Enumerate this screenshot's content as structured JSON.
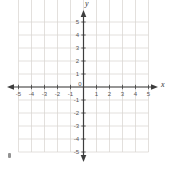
{
  "figure": {
    "background": "#ffffff",
    "axis_color": "#3d3d3d",
    "grid_color": "#d9d6d1",
    "tick_label_color": "#555555",
    "axis_label_color": "#333333",
    "origin_label": "0"
  },
  "chart_data": {
    "type": "scatter",
    "title": "",
    "xlabel": "x",
    "ylabel": "y",
    "xlim": [
      -5,
      5
    ],
    "ylim": [
      -5,
      5
    ],
    "x_ticks": [
      -5,
      -4,
      -3,
      -2,
      -1,
      1,
      2,
      3,
      4,
      5
    ],
    "y_ticks": [
      5,
      4,
      3,
      2,
      1,
      -1,
      -2,
      -3,
      -4,
      -5
    ],
    "grid": true,
    "points": []
  }
}
